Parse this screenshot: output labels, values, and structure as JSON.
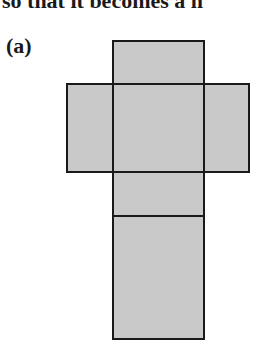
{
  "document": {
    "top_text_fragment": "so that it becomes a n",
    "figure_label": "(a)"
  },
  "figure": {
    "fill_color": "#c9c9c9",
    "stroke_color": "#1a1a1a",
    "faces": [
      {
        "name": "top-face",
        "x": 112,
        "y": 40,
        "w": 93,
        "h": 45
      },
      {
        "name": "left-face",
        "x": 66,
        "y": 83,
        "w": 48,
        "h": 90
      },
      {
        "name": "center-face",
        "x": 112,
        "y": 83,
        "w": 93,
        "h": 90
      },
      {
        "name": "right-face",
        "x": 203,
        "y": 83,
        "w": 47,
        "h": 90
      },
      {
        "name": "front-face",
        "x": 112,
        "y": 171,
        "w": 93,
        "h": 46
      },
      {
        "name": "bottom-face",
        "x": 112,
        "y": 215,
        "w": 93,
        "h": 125
      }
    ]
  }
}
